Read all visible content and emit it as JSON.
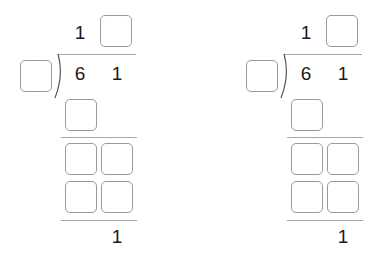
{
  "puzzles": [
    {
      "quotient": {
        "known_digit": "1",
        "blank_count": 1
      },
      "divisor": {
        "blank_count": 1
      },
      "dividend": {
        "digit_1": "6",
        "digit_2": "1"
      },
      "first_product": {
        "blank_count": 1
      },
      "remainder_work": {
        "rows": 2,
        "cols": 2
      },
      "final_remainder": "1"
    },
    {
      "quotient": {
        "known_digit": "1",
        "blank_count": 1
      },
      "divisor": {
        "blank_count": 1
      },
      "dividend": {
        "digit_1": "6",
        "digit_2": "1"
      },
      "first_product": {
        "blank_count": 1
      },
      "remainder_work": {
        "rows": 2,
        "cols": 2
      },
      "final_remainder": "1"
    }
  ],
  "colors": {
    "box_border": "#9a9a9a",
    "line": "#a8a8a8",
    "text": "#1a1a1a"
  }
}
